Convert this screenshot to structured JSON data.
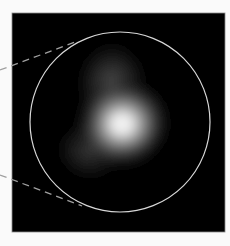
{
  "figure": {
    "type": "zoom-inset-panel",
    "background_color": "#fafafa",
    "panel": {
      "x": 12,
      "y": 13,
      "width": 213,
      "height": 219,
      "fill": "#000000",
      "border_color": "#8a8a8a"
    },
    "circle_outline": {
      "cx": 120,
      "cy": 122,
      "r": 90,
      "stroke": "#d8d8d8",
      "stroke_width": 1.2
    },
    "dashed_lines": [
      {
        "name": "upper-connector",
        "x1": 0,
        "y1": 70,
        "x2": 78,
        "y2": 41,
        "stroke": "#9a9a9a"
      },
      {
        "name": "lower-connector",
        "x1": 0,
        "y1": 175,
        "x2": 82,
        "y2": 206,
        "stroke": "#9a9a9a"
      }
    ],
    "glow": {
      "core": {
        "cx": 122,
        "cy": 124,
        "color": "#f4f4f4"
      },
      "upper_lobe": {
        "cx": 112,
        "cy": 82
      },
      "lower_left_lobe": {
        "cx": 88,
        "cy": 150
      }
    }
  }
}
